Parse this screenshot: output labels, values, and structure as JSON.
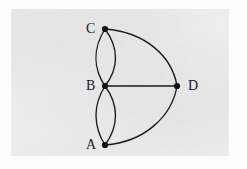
{
  "figure": {
    "background_color": "#fdfdfd",
    "panel_color": "#eeeeef",
    "ink_color": "#1a1a1c",
    "canvas": {
      "width": 247,
      "height": 169
    }
  },
  "graph": {
    "type": "multigraph",
    "vertices": [
      {
        "id": "C",
        "label": "C",
        "x": 105,
        "y": 29,
        "label_x": 86,
        "label_y": 22,
        "degree": 3
      },
      {
        "id": "B",
        "label": "B",
        "x": 105,
        "y": 86,
        "label_x": 86,
        "label_y": 79,
        "degree": 5
      },
      {
        "id": "A",
        "label": "A",
        "x": 105,
        "y": 145,
        "label_x": 86,
        "label_y": 138,
        "degree": 3
      },
      {
        "id": "D",
        "label": "D",
        "x": 177,
        "y": 86,
        "label_x": 188,
        "label_y": 79,
        "degree": 3
      }
    ],
    "edges": [
      {
        "id": "e1",
        "from": "C",
        "to": "B",
        "style": "curved",
        "bulge": "left",
        "path": "M 105 29 C 93 48, 93 68, 105 86"
      },
      {
        "id": "e2",
        "from": "C",
        "to": "B",
        "style": "curved",
        "bulge": "right",
        "path": "M 105 29 C 119 48, 119 68, 105 86"
      },
      {
        "id": "e3",
        "from": "B",
        "to": "A",
        "style": "curved",
        "bulge": "left",
        "path": "M 105 86 C 93 105, 93 126, 105 145"
      },
      {
        "id": "e4",
        "from": "B",
        "to": "A",
        "style": "curved",
        "bulge": "right",
        "path": "M 105 86 C 119 105, 119 126, 105 145"
      },
      {
        "id": "e5",
        "from": "C",
        "to": "D",
        "style": "curved",
        "bulge": "outer",
        "path": "M 105 29 C 145 32, 172 56, 177 86"
      },
      {
        "id": "e6",
        "from": "A",
        "to": "D",
        "style": "curved",
        "bulge": "outer",
        "path": "M 105 145 C 145 142, 172 116, 177 86"
      },
      {
        "id": "e7",
        "from": "B",
        "to": "D",
        "style": "straight",
        "bulge": "none",
        "path": "M 105 86 L 177 86"
      }
    ],
    "vertex_count": 4,
    "edge_count": 7
  }
}
